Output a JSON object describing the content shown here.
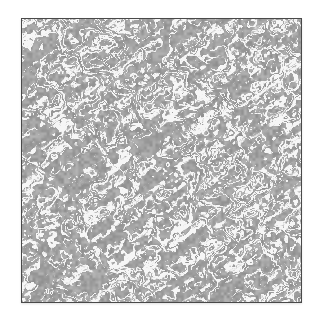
{
  "image": {
    "description": "Labyrinthine Turing-like pattern texture framed by a thin dark border",
    "pattern": "labyrinth-stripes",
    "colors": {
      "background": "#ffffff",
      "frame_border": "#4a4a4a",
      "pattern_dark": "#8e8e8e",
      "pattern_mid": "#b4b4b4",
      "pattern_light": "#f6f6f6"
    },
    "stripe_period_px": 7.5,
    "seed": 1337
  }
}
